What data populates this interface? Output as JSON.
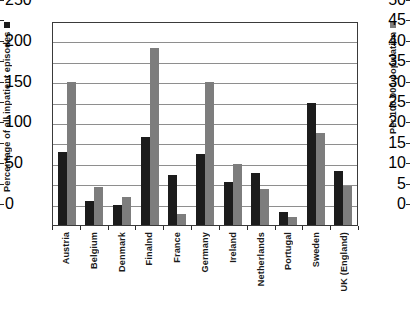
{
  "chart_data": {
    "type": "bar",
    "title": "",
    "subtitle": "",
    "xlabel": "",
    "grid": true,
    "legend_position": "axis-titles",
    "categories": [
      "Austria",
      "Belgium",
      "Denmark",
      "Finalnd",
      "France",
      "Germany",
      "Ireland",
      "Netherlands",
      "Portugal",
      "Sweden",
      "UK (England)"
    ],
    "series": [
      {
        "name": "Percentage of all inpatient episodes",
        "axis": "left",
        "color": "#1c1c1c",
        "swatch": "sw-black",
        "values": [
          18.0,
          6.0,
          4.8,
          21.5,
          12.2,
          17.3,
          10.6,
          12.8,
          3.3,
          30.0,
          13.3
        ]
      },
      {
        "name": "Per 100 000 population",
        "axis": "right",
        "color": "#7d7d7d",
        "swatch": "sw-gray",
        "values": [
          175,
          47,
          34,
          217,
          13,
          175,
          75,
          44,
          10,
          113,
          48
        ]
      }
    ],
    "left_axis": {
      "label": "Percentage of all inpatient episodes",
      "min": 0,
      "max": 50,
      "tick_step": 5,
      "ticks": [
        0,
        5,
        10,
        15,
        20,
        25,
        30,
        35,
        40,
        45,
        50
      ]
    },
    "right_axis": {
      "label": "Per 100 000 population",
      "min": 0,
      "max": 250,
      "tick_step": 25,
      "labelled_ticks": [
        0,
        50,
        100,
        150,
        200,
        250
      ],
      "ticks": [
        0,
        25,
        50,
        75,
        100,
        125,
        150,
        175,
        200,
        225,
        250
      ]
    }
  }
}
